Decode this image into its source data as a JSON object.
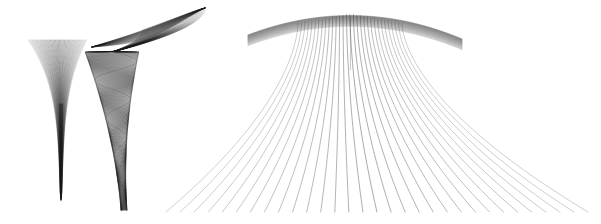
{
  "figure": {
    "title": "Three bundles of plane curves",
    "background_color": "#ffffff",
    "stroke_color": "#1a1a1a",
    "width": 601,
    "height": 224,
    "panel_count": 3,
    "panels": [
      {
        "name": "funnel-bundle",
        "label": "left funnel bundle",
        "description": "Family of curves fanning out from a narrow vertical tail into a wide conical mouth at the top.",
        "curve_count": 46,
        "accent_color": "#111111"
      },
      {
        "name": "oscillating-bundle",
        "label": "middle oscillating bundle",
        "description": "Family of curves with a dark swooping crest at upper right, descending into a tight oscillating vertical column.",
        "curve_count": 46,
        "accent_color": "#111111"
      },
      {
        "name": "dome-bundle",
        "label": "right dome bundle",
        "description": "Large fan of parabolic curves converging at a dense crest near the top and spreading outward to the baseline.",
        "curve_count": 31,
        "accent_color": "#2e2e2e"
      }
    ]
  },
  "chart_data": {
    "type": "line",
    "title": "Three bundles of plane curves",
    "xlabel": "",
    "ylabel": "",
    "grid": false,
    "legend": null,
    "axes_visible": false,
    "tick_labels_x": [],
    "tick_labels_y": [],
    "xlim": [
      0,
      601
    ],
    "ylim": [
      224,
      0
    ],
    "panels": [
      {
        "name": "funnel-bundle",
        "type": "line",
        "n_curves": 46,
        "apex": [
          58,
          198
        ],
        "mouth_left": [
          29,
          40
        ],
        "mouth_right": [
          86,
          37
        ],
        "tail_bottom": [
          61,
          200
        ],
        "waist": [
          56,
          104
        ],
        "stroke_width": 0.45,
        "darkest_region": [
          52,
          95,
          14,
          30
        ]
      },
      {
        "name": "oscillating-bundle",
        "type": "line",
        "n_curves": 46,
        "crest_peak": [
          205,
          8
        ],
        "crest_left": [
          92,
          47
        ],
        "column_top": [
          112,
          52
        ],
        "column_bottom": [
          124,
          210
        ],
        "oscillation_amplitude_top": 24,
        "oscillation_amplitude_bottom": 3,
        "stroke_width": 0.45
      },
      {
        "name": "dome-bundle",
        "type": "line",
        "n_curves": 31,
        "apex": [
          350,
          14
        ],
        "crest_band_left": [
          300,
          22
        ],
        "crest_band_right": [
          400,
          13
        ],
        "left_foot": [
          166,
          214
        ],
        "right_foot": [
          588,
          214
        ],
        "baseline_y": 212,
        "stroke_width": 0.55
      }
    ]
  }
}
